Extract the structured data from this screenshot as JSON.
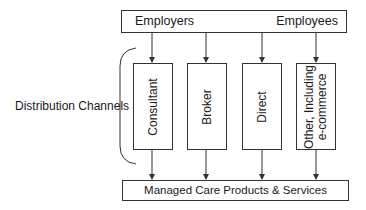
{
  "diagram": {
    "top": {
      "from_label": "Employers",
      "to_label": "Employees"
    },
    "side_label": "Distribution Channels",
    "channels": [
      {
        "label": "Consultant"
      },
      {
        "label": "Broker"
      },
      {
        "label": "Direct"
      },
      {
        "label_line1": "Other, Including",
        "label_line2": "e-commerce"
      }
    ],
    "bottom": {
      "label": "Managed Care Products & Services"
    },
    "colors": {
      "line": "#333333",
      "text": "#1a1a1a",
      "background": "#ffffff"
    }
  }
}
